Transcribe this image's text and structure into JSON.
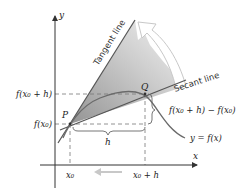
{
  "diagram": {
    "title": "",
    "axes": {
      "x_label": "x",
      "y_label": "y"
    },
    "points": {
      "P": "P",
      "Q": "Q"
    },
    "lines": {
      "tangent_label": "Tangent line",
      "secant_label": "Secant line"
    },
    "y_ticks": {
      "f_x0_h": "f(x₀ + h)",
      "f_x0": "f(x₀)"
    },
    "x_ticks": {
      "x0": "x₀",
      "x0_h": "x₀ + h"
    },
    "annotations": {
      "h": "h",
      "difference": "f(x₀ + h) − f(x₀)",
      "curve": "y = f(x)"
    },
    "colors": {
      "axis": "#333333",
      "tangent": "#555555",
      "secant": "#555555",
      "curve": "#666666",
      "shading_dark": "#9a9a9a",
      "shading_light": "#f2f2f2",
      "arrow": "#cfcfcf"
    }
  }
}
